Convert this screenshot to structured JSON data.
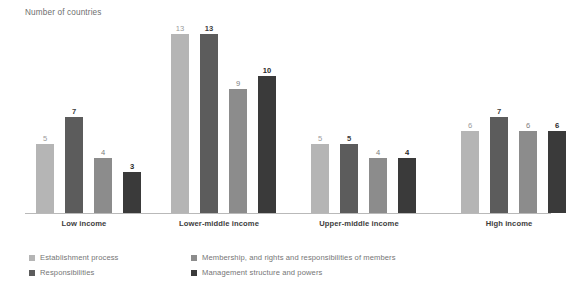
{
  "chart_data": {
    "type": "bar",
    "title": "Number of countries",
    "xlabel": "",
    "ylabel": "Number of countries",
    "ylim": [
      0,
      13.5
    ],
    "grid": false,
    "legend_position": "bottom-left",
    "categories": [
      "Low income",
      "Lower-middle income",
      "Upper-middle income",
      "High income"
    ],
    "series": [
      {
        "name": "Establishment process",
        "color": "#b5b5b5",
        "values": [
          5,
          13,
          5,
          6
        ]
      },
      {
        "name": "Responsibilities",
        "color": "#5c5c5c",
        "values": [
          7,
          13,
          5,
          7
        ]
      },
      {
        "name": "Membership, and rights and responsibilities of members",
        "color": "#8c8c8c",
        "values": [
          4,
          9,
          4,
          6
        ]
      },
      {
        "name": "Management structure and powers",
        "color": "#3a3a3a",
        "values": [
          3,
          10,
          4,
          6
        ]
      }
    ]
  },
  "axis": {
    "title": "Number of countries",
    "baseline_color": "#b9b9b9"
  },
  "groups": [
    {
      "label": "Low income",
      "bars": [
        {
          "value": "5",
          "n": 5,
          "color": "#b5b5b5",
          "label_color": "#9a9a9a",
          "bold": false
        },
        {
          "value": "7",
          "n": 7,
          "color": "#5c5c5c",
          "label_color": "#3d3d3d",
          "bold": true
        },
        {
          "value": "4",
          "n": 4,
          "color": "#8c8c8c",
          "label_color": "#7d7d7d",
          "bold": false
        },
        {
          "value": "3",
          "n": 3,
          "color": "#3a3a3a",
          "label_color": "#2b2b2b",
          "bold": true
        }
      ]
    },
    {
      "label": "Lower-middle income",
      "bars": [
        {
          "value": "13",
          "n": 13,
          "color": "#b5b5b5",
          "label_color": "#9a9a9a",
          "bold": false
        },
        {
          "value": "13",
          "n": 13,
          "color": "#5c5c5c",
          "label_color": "#3d3d3d",
          "bold": true
        },
        {
          "value": "9",
          "n": 9,
          "color": "#8c8c8c",
          "label_color": "#7d7d7d",
          "bold": false
        },
        {
          "value": "10",
          "n": 10,
          "color": "#3a3a3a",
          "label_color": "#2b2b2b",
          "bold": true
        }
      ]
    },
    {
      "label": "Upper-middle income",
      "bars": [
        {
          "value": "5",
          "n": 5,
          "color": "#b5b5b5",
          "label_color": "#9a9a9a",
          "bold": false
        },
        {
          "value": "5",
          "n": 5,
          "color": "#5c5c5c",
          "label_color": "#3d3d3d",
          "bold": true
        },
        {
          "value": "4",
          "n": 4,
          "color": "#8c8c8c",
          "label_color": "#7d7d7d",
          "bold": false
        },
        {
          "value": "4",
          "n": 4,
          "color": "#3a3a3a",
          "label_color": "#2b2b2b",
          "bold": true
        }
      ]
    },
    {
      "label": "High income",
      "bars": [
        {
          "value": "6",
          "n": 6,
          "color": "#b5b5b5",
          "label_color": "#9a9a9a",
          "bold": false
        },
        {
          "value": "7",
          "n": 7,
          "color": "#5c5c5c",
          "label_color": "#3d3d3d",
          "bold": true
        },
        {
          "value": "6",
          "n": 6,
          "color": "#8c8c8c",
          "label_color": "#7d7d7d",
          "bold": false
        },
        {
          "value": "6",
          "n": 6,
          "color": "#3a3a3a",
          "label_color": "#2b2b2b",
          "bold": true
        }
      ]
    }
  ],
  "legend": {
    "columns": [
      {
        "items": [
          {
            "label": "Establishment process",
            "color": "#b5b5b5"
          },
          {
            "label": "Responsibilities",
            "color": "#5c5c5c"
          }
        ]
      },
      {
        "items": [
          {
            "label": "Membership, and rights and responsibilities of members",
            "color": "#8c8c8c"
          },
          {
            "label": "Management structure and powers",
            "color": "#3a3a3a"
          }
        ]
      }
    ]
  }
}
